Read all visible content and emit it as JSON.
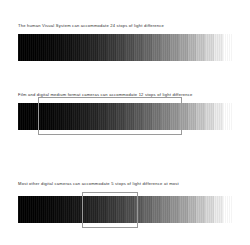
{
  "document": {
    "background_color": "#ffffff",
    "text_color": "#2b2b2b",
    "overlay_border_color": "#9a9a9a"
  },
  "panels": [
    {
      "id": "hvs",
      "caption": "The human Visual System can accommodate 24 stops of light difference",
      "stops": 24,
      "has_overlay": false
    },
    {
      "id": "film",
      "caption": "Film and digital medium format cameras can accommodate 12 stops of light difference",
      "stops": 12,
      "has_overlay": true,
      "overlay_start_stop": 3,
      "overlay_end_stop": 15
    },
    {
      "id": "dslr",
      "caption": "Most other digital cameras can accommodate 5 stops of light difference at most",
      "stops": 5,
      "has_overlay": true,
      "overlay_start_stop": 7,
      "overlay_end_stop": 12
    }
  ],
  "chart_data": {
    "type": "bar",
    "xlabel": "",
    "ylabel": "",
    "categories": [
      "The human Visual System",
      "Film and digital medium format cameras",
      "Most other digital cameras"
    ],
    "values": [
      24,
      12,
      5
    ],
    "units": "stops of light difference",
    "grid": false,
    "legend": "none",
    "gradient": {
      "steps": 24,
      "from": "#000000",
      "to": "#ffffff",
      "description": "Stepped grayscale wedge from black to white representing 24 stops"
    },
    "annotations": [
      {
        "target": "Film and digital medium format cameras",
        "label": "12 stops highlighted within the 24 stop wedge"
      },
      {
        "target": "Most other digital cameras",
        "label": "5 stops highlighted within the 24 stop wedge"
      }
    ]
  }
}
